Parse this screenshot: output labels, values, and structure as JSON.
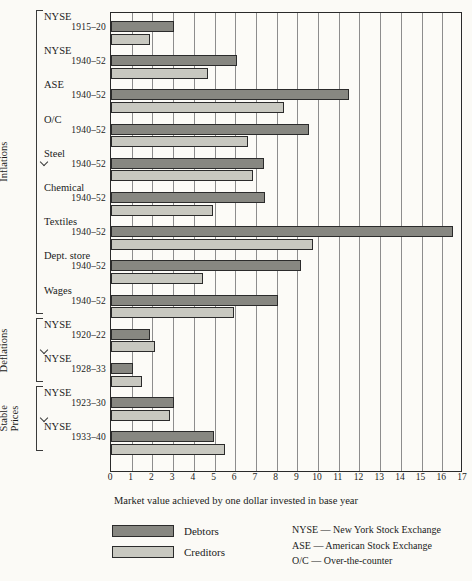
{
  "chart_data": {
    "type": "bar",
    "orientation": "horizontal",
    "title": "",
    "xlabel": "Market value achieved by one dollar invested in base year",
    "ylabel": "",
    "xlim": [
      0,
      17
    ],
    "xticks": [
      "0",
      "1",
      "2",
      "3",
      "4",
      "5",
      "6",
      "7",
      "8",
      "9",
      "10",
      "11",
      "12",
      "13",
      "14",
      "15",
      "16",
      "17"
    ],
    "grid": true,
    "legend_position": "below-left",
    "series": [
      {
        "name": "Debtors",
        "color": "#878781"
      },
      {
        "name": "Creditors",
        "color": "#c8c8c0"
      }
    ],
    "groups": [
      {
        "section": "Inflations",
        "categories": [
          {
            "name": "NYSE",
            "years": "1915–20",
            "debtors": 3.05,
            "creditors": 1.9
          },
          {
            "name": "NYSE",
            "years": "1940–52",
            "debtors": 6.1,
            "creditors": 4.7
          },
          {
            "name": "ASE",
            "years": "1940–52",
            "debtors": 11.5,
            "creditors": 8.35
          },
          {
            "name": "O/C",
            "years": "1940–52",
            "debtors": 9.55,
            "creditors": 6.6
          },
          {
            "name": "Steel",
            "years": "1940–52",
            "debtors": 7.4,
            "creditors": 6.85
          },
          {
            "name": "Chemical",
            "years": "1940–52",
            "debtors": 7.45,
            "creditors": 4.95
          },
          {
            "name": "Textiles",
            "years": "1940–52",
            "debtors": 16.5,
            "creditors": 9.75
          },
          {
            "name": "Dept. store",
            "years": "1940–52",
            "debtors": 9.2,
            "creditors": 4.45
          },
          {
            "name": "Wages",
            "years": "1940–52",
            "debtors": 8.05,
            "creditors": 5.95
          }
        ]
      },
      {
        "section": "Deflations",
        "categories": [
          {
            "name": "NYSE",
            "years": "1920–22",
            "debtors": 1.88,
            "creditors": 2.12
          },
          {
            "name": "NYSE",
            "years": "1928–33",
            "debtors": 1.05,
            "creditors": 1.52
          }
        ]
      },
      {
        "section": "Stable\nPrices",
        "categories": [
          {
            "name": "NYSE",
            "years": "1923–30",
            "debtors": 3.05,
            "creditors": 2.85
          },
          {
            "name": "NYSE",
            "years": "1933–40",
            "debtors": 4.97,
            "creditors": 5.5
          }
        ]
      }
    ]
  },
  "sections": {
    "inflations": "Inflations",
    "deflations": "Deflations",
    "stable_prices": "Stable Prices"
  },
  "legend": {
    "debtors": "Debtors",
    "creditors": "Creditors"
  },
  "abbreviations": [
    "NYSE — New York Stock Exchange",
    "ASE — American Stock Exchange",
    "O/C — Over-the-counter"
  ],
  "axis": {
    "caption": "Market value achieved by one dollar invested in base year"
  }
}
